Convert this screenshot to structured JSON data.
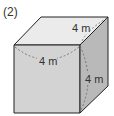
{
  "problem_label": "(2)",
  "figure": {
    "shape": "cube",
    "edge_labels": {
      "top_depth": "4 m",
      "front_width": "4 m",
      "right_height": "4 m"
    },
    "colors": {
      "top_face": "#ebebeb",
      "front_face": "#d3d3d3",
      "right_face": "#b9b9b9",
      "edge": "#222222",
      "dashed_arc": "#666666",
      "label_text": "#333333"
    }
  }
}
